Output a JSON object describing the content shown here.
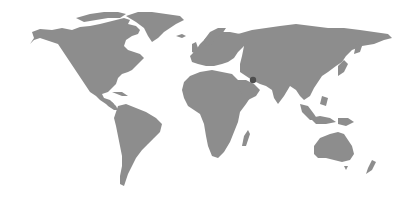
{
  "map": {
    "type": "world-choropleth",
    "background_color": "#ffffff",
    "land_color": "#8d8d8d",
    "highlight_color": "#4e4e4e",
    "highlight": {
      "region": "Persian Gulf / Iran",
      "x": 253,
      "y": 80
    }
  }
}
